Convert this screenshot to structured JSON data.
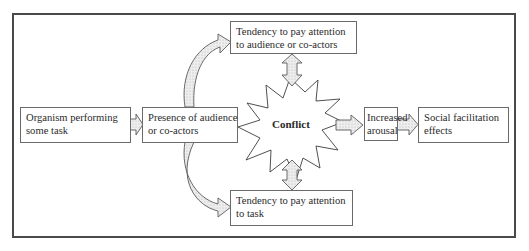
{
  "diagram": {
    "type": "flowchart",
    "nodes": {
      "organism": {
        "line1": "Organism performing",
        "line2": "some task"
      },
      "presence": {
        "line1": "Presence of audience",
        "line2": "or co-actors"
      },
      "attention_audience": {
        "line1": "Tendency to pay attention",
        "line2": "to audience or co-actors"
      },
      "attention_task": {
        "line1": "Tendency to pay attention",
        "line2": "to task"
      },
      "conflict": {
        "label": "Conflict"
      },
      "arousal": {
        "line1": "Increased",
        "line2": "arousal"
      },
      "effects": {
        "line1": "Social facilitation",
        "line2": "effects"
      }
    },
    "edges": [
      {
        "from": "organism",
        "to": "presence",
        "style": "block-arrow"
      },
      {
        "from": "presence",
        "to": "attention_audience",
        "style": "curved-block-arrow"
      },
      {
        "from": "presence",
        "to": "attention_task",
        "style": "curved-block-arrow"
      },
      {
        "from": "attention_audience",
        "to": "conflict",
        "style": "double-headed-block-arrow"
      },
      {
        "from": "attention_task",
        "to": "conflict",
        "style": "double-headed-block-arrow"
      },
      {
        "from": "conflict",
        "to": "arousal",
        "style": "block-arrow"
      },
      {
        "from": "arousal",
        "to": "effects",
        "style": "block-arrow"
      }
    ],
    "colors": {
      "stroke": "#5a5a5a",
      "arrow_fill": "#e4e4e4",
      "frame": "#4a4a4a"
    }
  }
}
